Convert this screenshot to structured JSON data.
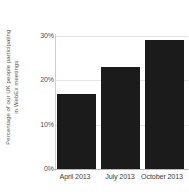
{
  "chart_data": {
    "type": "bar",
    "title": "",
    "subtitle": "",
    "xlabel": "",
    "ylabel": "Percentage of our UK people participating in WebEx meetings",
    "ylabel_lines": [
      "Percentage of our UK people participating",
      "in WebEx meetings"
    ],
    "categories": [
      "April 2013",
      "July 2013",
      "October 2013"
    ],
    "values": [
      17,
      23,
      29
    ],
    "value_labels": [
      "17%",
      "23%",
      "29%"
    ],
    "ylim": [
      0,
      30
    ],
    "ytick_values": [
      0,
      10,
      20,
      30
    ],
    "ytick_labels": [
      "0%",
      "10%",
      "20%",
      "30%"
    ],
    "grid": true,
    "grid_axis": "y",
    "legend": false,
    "legend_position": "none",
    "bar_color": "#1b1b1b",
    "gridline_color": "#e6e6e6",
    "axis_color": "#b9b9b9",
    "tick_label_color": "#4f4f4f",
    "axis_title_color": "#5a5a5a",
    "background_color": "#ffffff"
  }
}
